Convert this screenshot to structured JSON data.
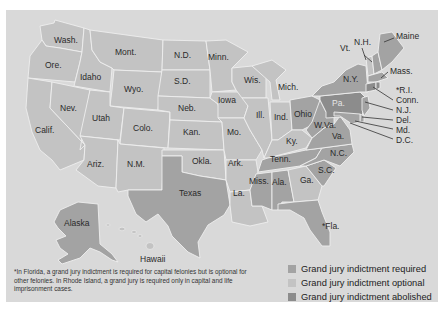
{
  "map": {
    "title": "",
    "colors": {
      "background": "#d9d9d9",
      "required": "#a3a3a3",
      "optional": "#c3c3c3",
      "abolished": "#8c8c8c"
    },
    "states": {
      "wash": {
        "label": "Wash.",
        "status": "optional"
      },
      "ore": {
        "label": "Ore.",
        "status": "optional"
      },
      "calif": {
        "label": "Calif.",
        "status": "optional"
      },
      "idaho": {
        "label": "Idaho",
        "status": "optional"
      },
      "nev": {
        "label": "Nev.",
        "status": "optional"
      },
      "mont": {
        "label": "Mont.",
        "status": "optional"
      },
      "wyo": {
        "label": "Wyo.",
        "status": "optional"
      },
      "utah": {
        "label": "Utah",
        "status": "optional"
      },
      "ariz": {
        "label": "Ariz.",
        "status": "optional"
      },
      "colo": {
        "label": "Colo.",
        "status": "optional"
      },
      "nm": {
        "label": "N.M.",
        "status": "optional"
      },
      "nd": {
        "label": "N.D.",
        "status": "optional"
      },
      "sd": {
        "label": "S.D.",
        "status": "optional"
      },
      "neb": {
        "label": "Neb.",
        "status": "optional"
      },
      "kan": {
        "label": "Kan.",
        "status": "optional"
      },
      "okla": {
        "label": "Okla.",
        "status": "optional"
      },
      "texas": {
        "label": "Texas",
        "status": "required"
      },
      "minn": {
        "label": "Minn.",
        "status": "optional"
      },
      "iowa": {
        "label": "Iowa",
        "status": "optional"
      },
      "mo": {
        "label": "Mo.",
        "status": "optional"
      },
      "ark": {
        "label": "Ark.",
        "status": "optional"
      },
      "la": {
        "label": "La.",
        "status": "optional"
      },
      "wis": {
        "label": "Wis.",
        "status": "optional"
      },
      "ill": {
        "label": "Ill.",
        "status": "optional"
      },
      "mich": {
        "label": "Mich.",
        "status": "optional"
      },
      "ind": {
        "label": "Ind.",
        "status": "optional"
      },
      "ohio": {
        "label": "Ohio",
        "status": "required"
      },
      "ky": {
        "label": "Ky.",
        "status": "optional"
      },
      "tenn": {
        "label": "Tenn.",
        "status": "required"
      },
      "miss": {
        "label": "Miss.",
        "status": "required"
      },
      "ala": {
        "label": "Ala.",
        "status": "required"
      },
      "ga": {
        "label": "Ga.",
        "status": "optional"
      },
      "fla": {
        "label": "*Fla.",
        "status": "required"
      },
      "sc": {
        "label": "S.C.",
        "status": "required"
      },
      "nc": {
        "label": "N.C.",
        "status": "required"
      },
      "va": {
        "label": "Va.",
        "status": "required"
      },
      "wva": {
        "label": "W.Va.",
        "status": "required"
      },
      "pa": {
        "label": "Pa.",
        "status": "abolished"
      },
      "ny": {
        "label": "N.Y.",
        "status": "required"
      },
      "vt": {
        "label": "Vt.",
        "status": "optional"
      },
      "nh": {
        "label": "N.H.",
        "status": "required"
      },
      "maine": {
        "label": "Maine",
        "status": "required"
      },
      "mass": {
        "label": "Mass.",
        "status": "required"
      },
      "ri": {
        "label": "*R.I.",
        "status": "abolished"
      },
      "conn": {
        "label": "Conn.",
        "status": "abolished"
      },
      "nj": {
        "label": "N.J.",
        "status": "required"
      },
      "del": {
        "label": "Del.",
        "status": "required"
      },
      "md": {
        "label": "Md.",
        "status": "required"
      },
      "dc": {
        "label": "D.C.",
        "status": "required"
      },
      "alaska": {
        "label": "Alaska",
        "status": "required"
      },
      "hawaii": {
        "label": "Hawaii",
        "status": "optional"
      }
    }
  },
  "legend": {
    "items": [
      {
        "label": "Grand jury indictment required",
        "color": "#a3a3a3"
      },
      {
        "label": "Grand jury indictment optional",
        "color": "#c3c3c3"
      },
      {
        "label": "Grand jury indictment abolished",
        "color": "#8c8c8c"
      }
    ]
  },
  "footnote": "*In Florida, a grand jury indictment is required for capital felonies but is optional for other felonies. In Rhode Island, a grand jury is required only in capital and life imprisonment cases."
}
